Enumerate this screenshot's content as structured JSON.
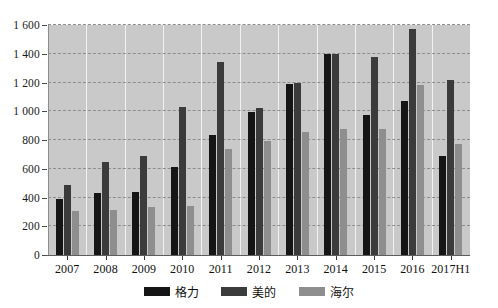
{
  "chart_data": {
    "type": "bar",
    "title": "",
    "subtitle": "",
    "xlabel": "",
    "ylabel": "",
    "ylim": [
      0,
      1600
    ],
    "ytick_step": 200,
    "ytick_labels": [
      "0",
      "200",
      "400",
      "600",
      "800",
      "1 000",
      "1 200",
      "1 400",
      "1 600"
    ],
    "ytick_values": [
      0,
      200,
      400,
      600,
      800,
      1000,
      1200,
      1400,
      1600
    ],
    "grid": true,
    "grid_axis": "y",
    "legend_position": "bottom-center",
    "categories": [
      "2007",
      "2008",
      "2009",
      "2010",
      "2011",
      "2012",
      "2013",
      "2014",
      "2015",
      "2016",
      "2017H1"
    ],
    "series": [
      {
        "name": "格力",
        "color": "#151515",
        "values": [
          390,
          430,
          435,
          610,
          835,
          995,
          1190,
          1395,
          975,
          1070,
          690
        ]
      },
      {
        "name": "美的",
        "color": "#3b3b3b",
        "values": [
          490,
          645,
          690,
          1030,
          1340,
          1025,
          1200,
          1400,
          1375,
          1570,
          1220
        ]
      },
      {
        "name": "海尔",
        "color": "#8e8e8e",
        "values": [
          305,
          310,
          335,
          340,
          735,
          790,
          855,
          880,
          880,
          1180,
          775
        ]
      }
    ],
    "plot_background": "#c9c9c9",
    "gridline_color": "#8d8d8d"
  },
  "legend": {
    "items": [
      {
        "label": "格力",
        "swatch": "#151515"
      },
      {
        "label": "美的",
        "swatch": "#3b3b3b"
      },
      {
        "label": "海尔",
        "swatch": "#8e8e8e"
      }
    ]
  }
}
